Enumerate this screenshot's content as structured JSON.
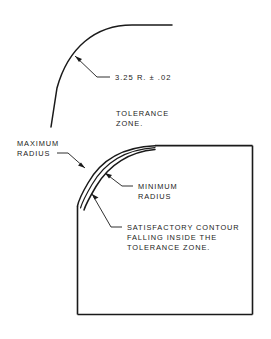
{
  "figure": {
    "type": "engineering-drawing",
    "background_color": "#ffffff",
    "line_color": "#1a1a1a"
  },
  "labels": {
    "dimension_radius": "3.25 R. ± .02",
    "tolerance_zone_line1": "TOLERANCE",
    "tolerance_zone_line2": "ZONE.",
    "maximum_radius_line1": "MAXIMUM",
    "maximum_radius_line2": "RADIUS",
    "minimum_radius_line1": "MINIMUM",
    "minimum_radius_line2": "RADIUS",
    "satisfactory_line1": "SATISFACTORY  CONTOUR",
    "satisfactory_line2": "FALLING  INSIDE  THE",
    "satisfactory_line3": "TOLERANCE  ZONE."
  },
  "caption": {
    "text": ""
  },
  "geometry": {
    "upper_arc": {
      "radius_nominal": 3.25,
      "tolerance": 0.02,
      "units": "inch"
    },
    "part_outline": {
      "left_x": 77,
      "top_y": 145,
      "right_x": 253,
      "bottom_y": 315
    },
    "band_arcs": 3
  }
}
